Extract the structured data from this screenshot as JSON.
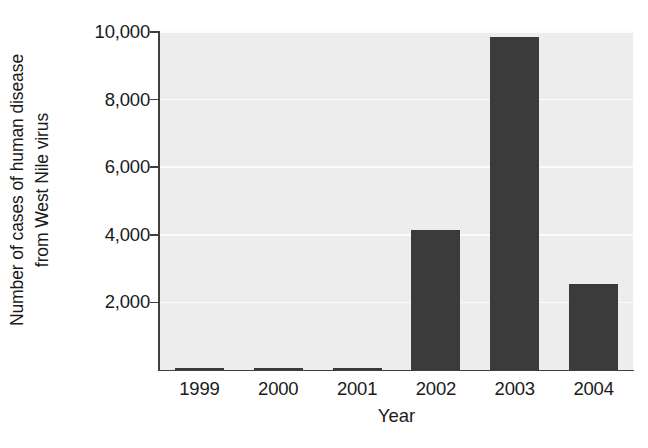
{
  "chart_data": {
    "type": "bar",
    "title": "",
    "subtitle": "",
    "categories": [
      "1999",
      "2000",
      "2001",
      "2002",
      "2003",
      "2004"
    ],
    "values": [
      62,
      21,
      66,
      4156,
      9862,
      2539
    ],
    "series": [
      {
        "name": "Cases of human disease from West Nile virus",
        "values": [
          62,
          21,
          66,
          4156,
          9862,
          2539
        ]
      }
    ],
    "xlabel": "Year",
    "ylabel": "Number of cases of human disease from West Nile virus",
    "ylabel_lines": [
      "Number of cases of human disease",
      "from West Nile virus"
    ],
    "ylim": [
      0,
      10000
    ],
    "yticks": [
      0,
      2000,
      4000,
      6000,
      8000,
      10000
    ],
    "ytick_labels": [
      "2,000",
      "4,000",
      "6,000",
      "8,000",
      "10,000"
    ],
    "ytick_values": [
      2000,
      4000,
      6000,
      8000,
      10000
    ],
    "xtick_labels": [
      "1999",
      "2000",
      "2001",
      "2002",
      "2003",
      "2004"
    ],
    "grid": true,
    "grid_axis": "y",
    "legend": false,
    "legend_position": "none",
    "bar_color": "#3b3b3b",
    "plot_background": "#ededed",
    "gridline_color": "#fbfbfb",
    "axis_color": "#3f3f3f",
    "figure_background": "#ffffff"
  }
}
